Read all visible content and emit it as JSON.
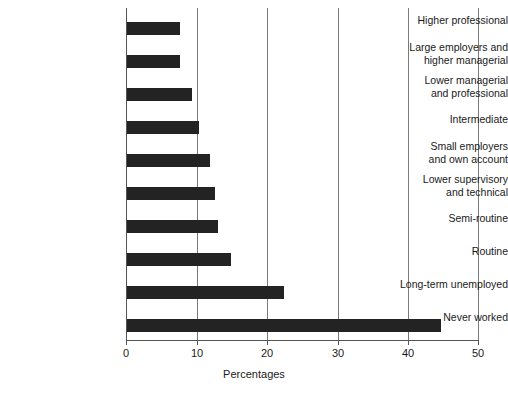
{
  "chart_data": {
    "type": "bar",
    "orientation": "horizontal",
    "title": "",
    "xlabel": "Percentages",
    "ylabel": "",
    "xlim": [
      0,
      50
    ],
    "xticks": [
      0,
      10,
      20,
      30,
      40,
      50
    ],
    "xtick_labels": [
      "0",
      "10",
      "20",
      "30",
      "40",
      "50"
    ],
    "grid": true,
    "grid_axis": "x",
    "legend": false,
    "bar_color": "#232323",
    "categories": [
      "Higher professional",
      "Large employers and\nhigher managerial",
      "Lower managerial\nand professional",
      "Intermediate",
      "Small employers\nand own account",
      "Lower supervisory\nand technical",
      "Semi-routine",
      "Routine",
      "Long-term unemployed",
      "Never worked"
    ],
    "values": [
      7.5,
      7.5,
      9.3,
      10.2,
      11.8,
      12.5,
      12.9,
      14.8,
      22.4,
      44.8
    ]
  }
}
